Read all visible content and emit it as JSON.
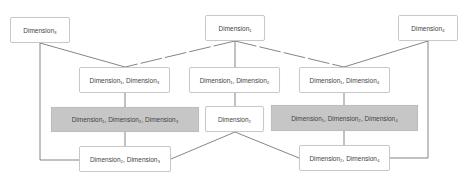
{
  "diagram": {
    "type": "lattice",
    "colors": {
      "node_fill": "#ffffff",
      "highlight_fill": "#c6c6c6",
      "edge": "#666666",
      "border": "#c9c9c9"
    },
    "nodes": [
      {
        "id": "d3",
        "label": "Dimension",
        "subs": [
          "3"
        ],
        "highlight": false,
        "box": [
          10,
          17,
          60,
          26
        ]
      },
      {
        "id": "d1",
        "label": "Dimension",
        "subs": [
          "1"
        ],
        "highlight": false,
        "box": [
          205,
          15,
          60,
          26
        ]
      },
      {
        "id": "d4",
        "label": "Dimension",
        "subs": [
          "4"
        ],
        "highlight": false,
        "box": [
          398,
          15,
          60,
          26
        ]
      },
      {
        "id": "d13",
        "label": "Dimension",
        "subs": [
          "1",
          "3"
        ],
        "highlight": false,
        "box": [
          79,
          67,
          91,
          26
        ]
      },
      {
        "id": "d12",
        "label": "Dimension",
        "subs": [
          "1",
          "2"
        ],
        "highlight": false,
        "box": [
          189,
          67,
          91,
          26
        ]
      },
      {
        "id": "d14",
        "label": "Dimension",
        "subs": [
          "1",
          "4"
        ],
        "highlight": false,
        "box": [
          299,
          67,
          91,
          26
        ]
      },
      {
        "id": "d123",
        "label": "Dimension",
        "subs": [
          "1",
          "2",
          "3"
        ],
        "highlight": true,
        "box": [
          51,
          107,
          148,
          25
        ]
      },
      {
        "id": "d2",
        "label": "Dimension",
        "subs": [
          "2"
        ],
        "highlight": false,
        "box": [
          205,
          106,
          59,
          26
        ]
      },
      {
        "id": "d124",
        "label": "Dimension",
        "subs": [
          "1",
          "2",
          "4"
        ],
        "highlight": true,
        "box": [
          271,
          105,
          147,
          26
        ]
      },
      {
        "id": "d23",
        "label": "Dimension",
        "subs": [
          "2",
          "3"
        ],
        "highlight": false,
        "box": [
          79,
          146,
          92,
          26
        ]
      },
      {
        "id": "d24",
        "label": "Dimension",
        "subs": [
          "2",
          "4"
        ],
        "highlight": false,
        "box": [
          299,
          145,
          91,
          26
        ]
      }
    ],
    "edges": [
      {
        "from": "d3",
        "to": "d13"
      },
      {
        "from": "d1",
        "to": "d13"
      },
      {
        "from": "d1",
        "to": "d12"
      },
      {
        "from": "d1",
        "to": "d14"
      },
      {
        "from": "d4",
        "to": "d14"
      },
      {
        "from": "d13",
        "to": "d123"
      },
      {
        "from": "d14",
        "to": "d124"
      },
      {
        "from": "d123",
        "to": "d23"
      },
      {
        "from": "d124",
        "to": "d24"
      },
      {
        "from": "d2",
        "to": "d23"
      },
      {
        "from": "d2",
        "to": "d24"
      },
      {
        "from": "d3",
        "to": "d23"
      },
      {
        "from": "d4",
        "to": "d24"
      },
      {
        "from": "d12",
        "to": "d2"
      }
    ]
  },
  "labels": {
    "d3": "Dimension₃",
    "d1": "Dimension₁",
    "d4": "Dimension₄",
    "d13": "Dimension₁, Dimension₃",
    "d12": "Dimension₁, Dimension₂",
    "d14": "Dimension₁, Dimension₄",
    "d123": "Dimension₁, Dimension₂, Dimension₃",
    "d2": "Dimension₂",
    "d124": "Dimension₁, Dimension₂, Dimension₄",
    "d23": "Dimension₂, Dimension₃",
    "d24": "Dimension₂, Dimension₄"
  }
}
